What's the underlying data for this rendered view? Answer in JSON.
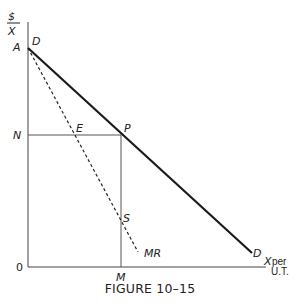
{
  "figure": {
    "caption": "FIGURE 10–15",
    "y_axis_label_top": "$",
    "y_axis_label_bottom": "X",
    "x_axis_label_main": "X",
    "x_axis_label_sub1": "per",
    "x_axis_label_sub2": "U.T.",
    "origin_label": "0"
  },
  "points": {
    "A": "A",
    "N": "N",
    "M": "M",
    "E": "E",
    "P": "P",
    "S": "S"
  },
  "curves": {
    "demand_start_label": "D",
    "demand_end_label": "D",
    "mr_label": "MR"
  },
  "colors": {
    "line": "#222222",
    "guide": "#666666"
  }
}
